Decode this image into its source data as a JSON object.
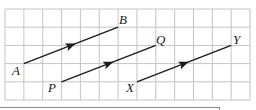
{
  "diagram": {
    "type": "vector-grid",
    "grid": {
      "columns": 13,
      "rows": 5,
      "origin_px": [
        5,
        9
      ],
      "cell_w": 18.85,
      "cell_h": 18.2,
      "line_color": "#c4c4c4"
    },
    "segments": [
      {
        "id": "AB",
        "from": {
          "label": "A",
          "col": 1,
          "row": 3
        },
        "to": {
          "label": "B",
          "col": 6,
          "row": 1
        },
        "arrow_at": 0.5
      },
      {
        "id": "PQ",
        "from": {
          "label": "P",
          "col": 3,
          "row": 4
        },
        "to": {
          "label": "Q",
          "col": 8,
          "row": 2
        },
        "arrow_at": 0.5
      },
      {
        "id": "XY",
        "from": {
          "label": "X",
          "col": 7,
          "row": 4
        },
        "to": {
          "label": "Y",
          "col": 12,
          "row": 2
        },
        "arrow_at": 0.5
      }
    ],
    "labels": {
      "A": "A",
      "B": "B",
      "P": "P",
      "Q": "Q",
      "X": "X",
      "Y": "Y"
    },
    "line_color": "#1a1a1a"
  }
}
